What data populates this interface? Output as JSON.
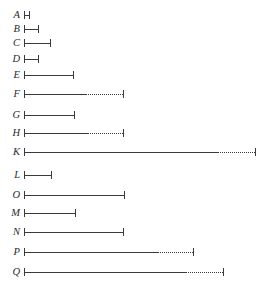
{
  "figure": {
    "type": "range-bar-chart",
    "background_color": "#ffffff",
    "line_color": "#3a3a3a",
    "label_color": "#2b2b2b",
    "axis_visible": false,
    "gridlines": false
  },
  "chart_data": {
    "type": "bar",
    "title": "",
    "xlabel": "",
    "ylabel": "",
    "orientation": "horizontal",
    "categories": [
      "A",
      "B",
      "C",
      "D",
      "E",
      "F",
      "G",
      "H",
      "K",
      "L",
      "O",
      "M",
      "N",
      "P",
      "Q"
    ],
    "x_start": 24,
    "xlim": [
      24,
      256
    ],
    "series": [
      {
        "name": "solid span",
        "values": [
          5,
          14,
          26,
          14,
          49,
          62,
          50,
          63,
          194,
          27,
          100,
          51,
          99,
          133,
          161
        ]
      },
      {
        "name": "dotted continuation",
        "values": [
          0,
          0,
          0,
          0,
          0,
          37,
          0,
          36,
          37,
          0,
          0,
          0,
          0,
          36,
          38
        ]
      }
    ],
    "rows": [
      {
        "label": "A",
        "y": 15,
        "start": 24,
        "solid_end": 29,
        "dotted_end": 29,
        "has_dotted": false
      },
      {
        "label": "B",
        "y": 29,
        "start": 24,
        "solid_end": 38,
        "dotted_end": 38,
        "has_dotted": false
      },
      {
        "label": "C",
        "y": 43,
        "start": 24,
        "solid_end": 50,
        "dotted_end": 50,
        "has_dotted": false
      },
      {
        "label": "D",
        "y": 59,
        "start": 24,
        "solid_end": 38,
        "dotted_end": 38,
        "has_dotted": false
      },
      {
        "label": "E",
        "y": 75,
        "start": 24,
        "solid_end": 73,
        "dotted_end": 73,
        "has_dotted": false
      },
      {
        "label": "F",
        "y": 94,
        "start": 24,
        "solid_end": 86,
        "dotted_end": 123,
        "has_dotted": true
      },
      {
        "label": "G",
        "y": 115,
        "start": 24,
        "solid_end": 74,
        "dotted_end": 74,
        "has_dotted": false
      },
      {
        "label": "H",
        "y": 133,
        "start": 24,
        "solid_end": 87,
        "dotted_end": 123,
        "has_dotted": true
      },
      {
        "label": "K",
        "y": 152,
        "start": 24,
        "solid_end": 218,
        "dotted_end": 255,
        "has_dotted": true
      },
      {
        "label": "L",
        "y": 175,
        "start": 24,
        "solid_end": 51,
        "dotted_end": 51,
        "has_dotted": false
      },
      {
        "label": "O",
        "y": 195,
        "start": 24,
        "solid_end": 124,
        "dotted_end": 124,
        "has_dotted": false
      },
      {
        "label": "M",
        "y": 213,
        "start": 24,
        "solid_end": 75,
        "dotted_end": 75,
        "has_dotted": false
      },
      {
        "label": "N",
        "y": 232,
        "start": 24,
        "solid_end": 123,
        "dotted_end": 123,
        "has_dotted": false
      },
      {
        "label": "P",
        "y": 252,
        "start": 24,
        "solid_end": 157,
        "dotted_end": 193,
        "has_dotted": true
      },
      {
        "label": "Q",
        "y": 272,
        "start": 24,
        "solid_end": 185,
        "dotted_end": 223,
        "has_dotted": true
      }
    ]
  }
}
